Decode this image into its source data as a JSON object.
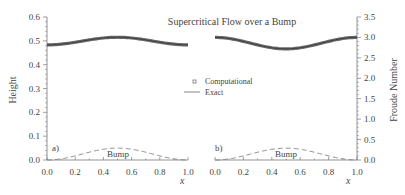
{
  "chart_data": [
    {
      "type": "line",
      "panel": "a",
      "title": "Supercritical Flow over a Bump",
      "xlabel": "x",
      "ylabel": "Height",
      "xlim": [
        0.0,
        1.0
      ],
      "ylim": [
        0.0,
        0.6
      ],
      "xticks": [
        "0.0",
        "0.2",
        "0.4",
        "0.6",
        "0.8",
        "1.0"
      ],
      "yticks": [
        "0.0",
        "0.1",
        "0.2",
        "0.3",
        "0.4",
        "0.5",
        "0.6"
      ],
      "series": [
        {
          "name": "Computational",
          "style": "markers",
          "x": [
            0.0,
            0.1,
            0.2,
            0.3,
            0.4,
            0.5,
            0.6,
            0.7,
            0.8,
            0.9,
            1.0
          ],
          "values": [
            0.483,
            0.485,
            0.491,
            0.5,
            0.51,
            0.515,
            0.51,
            0.5,
            0.491,
            0.485,
            0.483
          ]
        },
        {
          "name": "Exact",
          "style": "solid",
          "x": [
            0.0,
            0.1,
            0.2,
            0.3,
            0.4,
            0.5,
            0.6,
            0.7,
            0.8,
            0.9,
            1.0
          ],
          "values": [
            0.483,
            0.485,
            0.491,
            0.5,
            0.51,
            0.515,
            0.51,
            0.5,
            0.491,
            0.485,
            0.483
          ]
        },
        {
          "name": "Bump",
          "style": "dashed",
          "x": [
            0.0,
            0.1,
            0.2,
            0.3,
            0.4,
            0.5,
            0.6,
            0.7,
            0.8,
            0.9,
            1.0
          ],
          "values": [
            0.0,
            0.005,
            0.018,
            0.034,
            0.047,
            0.05,
            0.047,
            0.034,
            0.018,
            0.005,
            0.0
          ]
        }
      ],
      "annotations": [
        "a)",
        "Bump"
      ]
    },
    {
      "type": "line",
      "panel": "b",
      "xlabel": "x",
      "ylabel": "Froude Number",
      "xlim": [
        0.0,
        1.0
      ],
      "ylim": [
        0.0,
        3.5
      ],
      "xticks": [
        "0.0",
        "0.2",
        "0.4",
        "0.6",
        "0.8",
        "1.0"
      ],
      "yticks": [
        "0.0",
        "0.5",
        "1.0",
        "1.5",
        "2.0",
        "2.5",
        "3.0",
        "3.5"
      ],
      "series": [
        {
          "name": "Computational",
          "style": "markers",
          "x": [
            0.0,
            0.1,
            0.2,
            0.3,
            0.4,
            0.5,
            0.6,
            0.7,
            0.8,
            0.9,
            1.0
          ],
          "values": [
            3.0,
            2.98,
            2.93,
            2.84,
            2.76,
            2.72,
            2.76,
            2.84,
            2.93,
            2.98,
            3.0
          ]
        },
        {
          "name": "Exact",
          "style": "solid",
          "x": [
            0.0,
            0.1,
            0.2,
            0.3,
            0.4,
            0.5,
            0.6,
            0.7,
            0.8,
            0.9,
            1.0
          ],
          "values": [
            3.0,
            2.98,
            2.93,
            2.84,
            2.76,
            2.72,
            2.76,
            2.84,
            2.93,
            2.98,
            3.0
          ]
        },
        {
          "name": "Bump",
          "style": "dashed",
          "x": [
            0.0,
            0.1,
            0.2,
            0.3,
            0.4,
            0.5,
            0.6,
            0.7,
            0.8,
            0.9,
            1.0
          ],
          "values": [
            0.0,
            0.03,
            0.1,
            0.2,
            0.27,
            0.29,
            0.27,
            0.2,
            0.1,
            0.03,
            0.0
          ]
        }
      ],
      "annotations": [
        "b)",
        "Bump"
      ]
    }
  ],
  "labels": {
    "title": "Supercritical Flow over a Bump",
    "left_ylabel": "Height",
    "right_ylabel": "Froude Number",
    "xlabel": "x",
    "legend_computational": "Computational",
    "legend_exact": "Exact",
    "panel_a": "a)",
    "panel_b": "b)",
    "bump_label": "Bump"
  }
}
